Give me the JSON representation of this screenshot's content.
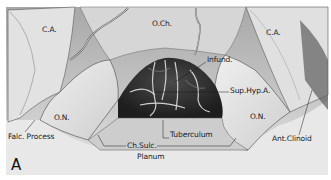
{
  "figure": {
    "panel_letter": "A",
    "labels": {
      "carotid_left": "C.A.",
      "optic_chiasm": "O.Ch.",
      "carotid_right": "C.A.",
      "infundibulum": "Infund.",
      "superior_hypophyseal_artery": "Sup.Hyp.A.",
      "optic_nerve_left": "O.N.",
      "optic_nerve_right": "O.N.",
      "falciform_process": "Falc. Process",
      "chiasmatic_sulcus": "Ch.Sulc.",
      "planum": "Planum",
      "tuberculum": "Tuberculum",
      "anterior_clinoid": "Ant.Clinoid"
    },
    "colors": {
      "background": "#ffffff",
      "illustration_light": "#d9d9d9",
      "illustration_mid": "#9a9a9a",
      "illustration_dark": "#2b2b2b",
      "label_text": "#1a1a1a"
    }
  }
}
